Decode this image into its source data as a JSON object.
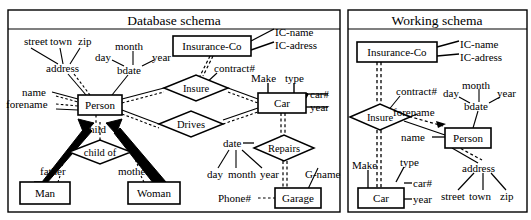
{
  "panels": [
    {
      "id": "database-schema",
      "title": "Database schema",
      "entities": [
        {
          "name": "Insurance-Co",
          "x": 173,
          "y": 36,
          "w": 78,
          "h": 20
        },
        {
          "name": "Person",
          "x": 78,
          "y": 95,
          "w": 44,
          "h": 20
        },
        {
          "name": "Car",
          "x": 258,
          "y": 93,
          "w": 48,
          "h": 20
        },
        {
          "name": "Man",
          "x": 20,
          "y": 182,
          "w": 50,
          "h": 22
        },
        {
          "name": "Woman",
          "x": 128,
          "y": 182,
          "w": 52,
          "h": 22
        },
        {
          "name": "Garage",
          "x": 275,
          "y": 188,
          "w": 46,
          "h": 20
        }
      ],
      "relationships": [
        {
          "name": "Insure",
          "cx": 196,
          "cy": 88,
          "rx": 32,
          "ry": 13
        },
        {
          "name": "Drives",
          "cx": 191,
          "cy": 124,
          "rx": 32,
          "ry": 13
        },
        {
          "name": "child of",
          "cx": 100,
          "cy": 152,
          "rx": 31,
          "ry": 12
        },
        {
          "name": "Repairs",
          "cx": 284,
          "cy": 148,
          "rx": 30,
          "ry": 13
        }
      ],
      "attributes": [
        {
          "name": "street",
          "x": 24,
          "y": 45
        },
        {
          "name": "town",
          "x": 50,
          "y": 45
        },
        {
          "name": "zip",
          "x": 76,
          "y": 45
        },
        {
          "name": "address",
          "x": 51,
          "y": 70
        },
        {
          "name": "day",
          "x": 101,
          "y": 58
        },
        {
          "name": "month",
          "x": 126,
          "y": 48
        },
        {
          "name": "year",
          "x": 155,
          "y": 58
        },
        {
          "name": "bdate",
          "x": 125,
          "y": 71
        },
        {
          "name": "name",
          "x": 32,
          "y": 96
        },
        {
          "name": "forename",
          "x": 24,
          "y": 107
        },
        {
          "name": "IC-name",
          "x": 277,
          "y": 32
        },
        {
          "name": "IC-adress",
          "x": 277,
          "y": 45
        },
        {
          "name": "contract#",
          "x": 218,
          "y": 70
        },
        {
          "name": "Make",
          "x": 254,
          "y": 80
        },
        {
          "name": "type",
          "x": 288,
          "y": 80
        },
        {
          "name": "car#",
          "x": 310,
          "y": 97
        },
        {
          "name": "year",
          "x": 310,
          "y": 110
        },
        {
          "name": "child",
          "x": 85,
          "y": 129
        },
        {
          "name": "father",
          "x": 55,
          "y": 172
        },
        {
          "name": "mother",
          "x": 123,
          "y": 172
        },
        {
          "name": "date",
          "x": 228,
          "y": 146
        },
        {
          "name": "day",
          "x": 213,
          "y": 174
        },
        {
          "name": "month",
          "x": 236,
          "y": 174
        },
        {
          "name": "year",
          "x": 268,
          "y": 174
        },
        {
          "name": "G-name",
          "x": 309,
          "y": 174
        },
        {
          "name": "Phone#",
          "x": 229,
          "y": 200
        }
      ]
    },
    {
      "id": "working-schema",
      "title": "Working schema",
      "entities": [
        {
          "name": "Insurance-Co",
          "x": 357,
          "y": 42,
          "w": 80,
          "h": 20
        },
        {
          "name": "Person",
          "x": 445,
          "y": 128,
          "w": 46,
          "h": 20
        },
        {
          "name": "Car",
          "x": 358,
          "y": 188,
          "w": 46,
          "h": 20
        }
      ],
      "relationships": [
        {
          "name": "Insure",
          "cx": 380,
          "cy": 117,
          "rx": 30,
          "ry": 13
        }
      ],
      "attributes": [
        {
          "name": "IC-name",
          "x": 461,
          "y": 44
        },
        {
          "name": "IC-adress",
          "x": 461,
          "y": 57
        },
        {
          "name": "contract#",
          "x": 400,
          "y": 93
        },
        {
          "name": "day",
          "x": 447,
          "y": 94
        },
        {
          "name": "month",
          "x": 473,
          "y": 86
        },
        {
          "name": "year",
          "x": 502,
          "y": 94
        },
        {
          "name": "bdate",
          "x": 471,
          "y": 107
        },
        {
          "name": "forename",
          "x": 419,
          "y": 112
        },
        {
          "name": "name",
          "x": 406,
          "y": 140
        },
        {
          "name": "Make",
          "x": 355,
          "y": 167
        },
        {
          "name": "type",
          "x": 404,
          "y": 163
        },
        {
          "name": "car#",
          "x": 413,
          "y": 186
        },
        {
          "name": "year",
          "x": 413,
          "y": 202
        },
        {
          "name": "address",
          "x": 468,
          "y": 170
        },
        {
          "name": "street",
          "x": 447,
          "y": 197
        },
        {
          "name": "town",
          "x": 474,
          "y": 197
        },
        {
          "name": "zip",
          "x": 503,
          "y": 197
        }
      ]
    }
  ],
  "colors": {
    "ink": "#000000",
    "paper": "#ffffff"
  }
}
